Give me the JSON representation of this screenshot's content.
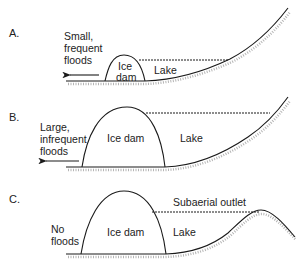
{
  "figure": {
    "panels": [
      {
        "id": "A",
        "label": "A.",
        "flood_text": [
          "Small,",
          "frequent",
          "floods"
        ],
        "ice_text": [
          "Ice",
          "dam"
        ],
        "lake_text": "Lake"
      },
      {
        "id": "B",
        "label": "B.",
        "flood_text": [
          "Large,",
          "infrequent",
          "floods"
        ],
        "ice_text": [
          "Ice dam"
        ],
        "lake_text": "Lake"
      },
      {
        "id": "C",
        "label": "C.",
        "flood_text": [
          "No",
          "floods"
        ],
        "ice_text": [
          "Ice dam"
        ],
        "lake_text": "Lake",
        "outlet_text": "Subaerial outlet"
      }
    ],
    "colors": {
      "line": "#1a1a1a",
      "stipple": "#b5b5b5",
      "background": "#ffffff"
    }
  }
}
